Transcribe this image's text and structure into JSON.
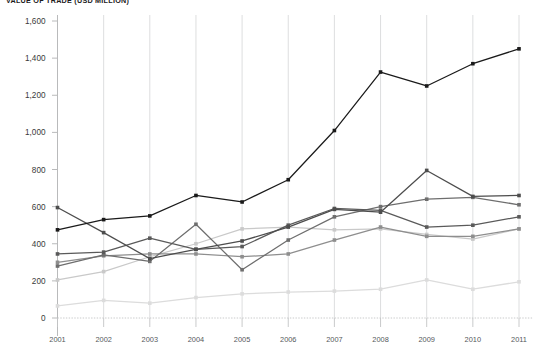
{
  "chart_data": {
    "type": "line",
    "title": "VALUE OF TRADE (USD MILLION)",
    "xlabel": "",
    "ylabel": "",
    "categories": [
      "2001",
      "2002",
      "2003",
      "2004",
      "2005",
      "2006",
      "2007",
      "2008",
      "2009",
      "2010",
      "2011"
    ],
    "x": [
      2001,
      2002,
      2003,
      2004,
      2005,
      2006,
      2007,
      2008,
      2009,
      2010,
      2011
    ],
    "ylim": [
      0,
      1600
    ],
    "yticks": [
      0,
      200,
      400,
      600,
      800,
      1000,
      1200,
      1400,
      1600
    ],
    "ytick_labels": [
      "0",
      "200",
      "400",
      "600",
      "800",
      "1,000",
      "1,200",
      "1,400",
      "1,600"
    ],
    "grid": "vertical",
    "legend": "none",
    "marker": "square",
    "series": [
      {
        "name": "series-1",
        "color": "#1a1a1a",
        "values": [
          475,
          530,
          550,
          660,
          625,
          745,
          1010,
          1325,
          1250,
          1370,
          1450
        ]
      },
      {
        "name": "series-2",
        "color": "#4d4d4d",
        "values": [
          595,
          460,
          320,
          370,
          415,
          490,
          585,
          570,
          795,
          655,
          660
        ]
      },
      {
        "name": "series-3",
        "color": "#6e6e6e",
        "values": [
          280,
          340,
          305,
          505,
          260,
          420,
          545,
          600,
          640,
          650,
          610
        ]
      },
      {
        "name": "series-4",
        "color": "#5a5a5a",
        "values": [
          345,
          355,
          430,
          370,
          385,
          500,
          590,
          580,
          490,
          500,
          545
        ]
      },
      {
        "name": "series-5",
        "color": "#8e8e8e",
        "values": [
          300,
          335,
          345,
          345,
          330,
          345,
          420,
          490,
          440,
          440,
          480
        ]
      },
      {
        "name": "series-6",
        "color": "#c9c9c9",
        "values": [
          205,
          250,
          330,
          400,
          480,
          490,
          475,
          480,
          450,
          425,
          480
        ]
      },
      {
        "name": "series-7",
        "color": "#dcdcdc",
        "values": [
          65,
          95,
          80,
          110,
          130,
          140,
          145,
          155,
          205,
          155,
          195
        ]
      }
    ]
  }
}
